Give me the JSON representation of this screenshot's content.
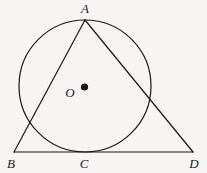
{
  "figure": {
    "kind": "geometry-diagram",
    "canvas": {
      "width": 207,
      "height": 173
    },
    "background_color": "#f6f5f3",
    "stroke_color": "#18181a",
    "label_color": "#18181a",
    "stroke_width": 1.2,
    "circle": {
      "name": "main-circle",
      "center_label": "O",
      "cx": 85,
      "cy": 86,
      "r": 66
    },
    "center_dot": {
      "name": "center-point-O",
      "cx": 84.5,
      "cy": 87,
      "r": 3.6,
      "fill": "#18181a"
    },
    "points": [
      {
        "id": "A",
        "label": "A",
        "x": 85,
        "y": 20,
        "label_x": 85,
        "label_y": 13
      },
      {
        "id": "B",
        "label": "B",
        "x": 14,
        "y": 152,
        "label_x": 11,
        "label_y": 168
      },
      {
        "id": "C",
        "label": "C",
        "x": 85,
        "y": 152,
        "label_x": 84,
        "label_y": 168
      },
      {
        "id": "D",
        "label": "D",
        "x": 193,
        "y": 152,
        "label_x": 194,
        "label_y": 168
      },
      {
        "id": "O",
        "label": "O",
        "x": 85,
        "y": 86,
        "label_x": 70,
        "label_y": 97
      }
    ],
    "segments": [
      {
        "id": "AB",
        "name": "segment-AB",
        "x1": 85,
        "y1": 20,
        "x2": 14,
        "y2": 152
      },
      {
        "id": "AD",
        "name": "segment-AD",
        "x1": 85,
        "y1": 20,
        "x2": 193,
        "y2": 152
      },
      {
        "id": "BD",
        "name": "segment-BD",
        "x1": 14,
        "y1": 152,
        "x2": 193,
        "y2": 152
      }
    ],
    "labels": {
      "A": "A",
      "B": "B",
      "C": "C",
      "D": "D",
      "O": "O"
    }
  }
}
